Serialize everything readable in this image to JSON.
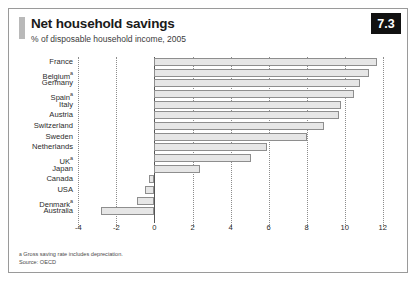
{
  "header": {
    "title": "Net household savings",
    "subtitle": "% of disposable household income, 2005",
    "badge": "7.3"
  },
  "footer": {
    "footnote_marker": "a",
    "footnote": "Gross saving rate includes depreciation.",
    "source": "Source: OECD"
  },
  "colors": {
    "bar_fill": "#e6e6e6",
    "bar_stroke": "#8e8e8e",
    "badge_bg": "#111111",
    "badge_text": "#ffffff",
    "frame": "#9a9a9a",
    "gridline": "#8c8c8c",
    "zero_line": "#555555"
  },
  "chart_data": {
    "type": "bar",
    "orientation": "horizontal",
    "title": "Net household savings",
    "subtitle": "% of disposable household income, 2005",
    "xlabel": "",
    "ylabel": "",
    "xlim": [
      -4,
      12
    ],
    "xticks": [
      -4,
      -2,
      0,
      2,
      4,
      6,
      8,
      10,
      12
    ],
    "grid": true,
    "legend": false,
    "categories": [
      "France",
      "Belgium",
      "Germany",
      "Spain",
      "Italy",
      "Austria",
      "Switzerland",
      "Sweden",
      "Netherlands",
      "UK",
      "Japan",
      "Canada",
      "USA",
      "Denmark",
      "Australia"
    ],
    "category_footnotes": [
      "",
      "a",
      "",
      "a",
      "",
      "",
      "",
      "",
      "",
      "a",
      "",
      "",
      "",
      "a",
      ""
    ],
    "values": [
      11.7,
      11.3,
      10.8,
      10.5,
      9.8,
      9.7,
      8.9,
      8.0,
      5.9,
      5.1,
      2.4,
      -0.3,
      -0.5,
      -0.9,
      -2.8
    ]
  }
}
